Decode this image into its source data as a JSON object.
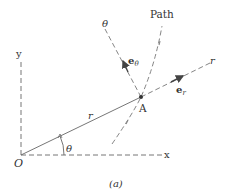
{
  "diagram": {
    "caption": "(a)",
    "origin_label": "O",
    "x_axis_label": "x",
    "y_axis_label": "y",
    "radial_axis_label": "r",
    "transverse_axis_label": "θ",
    "path_label": "Path",
    "point_label": "A",
    "radius_label": "r",
    "angle_label": "θ",
    "unit_vector_r": {
      "base": "e",
      "sub": "r"
    },
    "unit_vector_theta": {
      "base": "e",
      "sub": "θ"
    },
    "colors": {
      "line": "#555555",
      "text": "#333333",
      "background": "#ffffff"
    }
  }
}
